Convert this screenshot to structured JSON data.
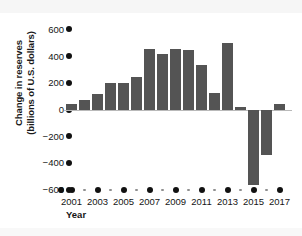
{
  "chart_data": {
    "type": "bar",
    "title": "",
    "xlabel": "Year",
    "ylabel": "Change in reserves\n(billions of U.S. dollars)",
    "categories": [
      2001,
      2002,
      2003,
      2004,
      2005,
      2006,
      2007,
      2008,
      2009,
      2010,
      2011,
      2012,
      2013,
      2014,
      2015,
      2016,
      2017
    ],
    "values": [
      45,
      75,
      120,
      205,
      205,
      250,
      460,
      420,
      460,
      450,
      340,
      130,
      500,
      20,
      -560,
      -340,
      45
    ],
    "ylim": [
      -600,
      600
    ],
    "ytick_labels": [
      "600",
      "400",
      "200",
      "0",
      "−200",
      "−400",
      "−600"
    ],
    "ytick_values": [
      600,
      400,
      200,
      0,
      -200,
      -400,
      -600
    ],
    "xtick_labels": [
      "2001",
      "2003",
      "2005",
      "2007",
      "2009",
      "2011",
      "2013",
      "2015",
      "2017"
    ],
    "xtick_values": [
      2001,
      2003,
      2005,
      2007,
      2009,
      2011,
      2013,
      2015,
      2017
    ],
    "minor_xtick_values": [
      2002,
      2004,
      2006,
      2008,
      2010,
      2012,
      2014,
      2016
    ],
    "grid": false,
    "legend": null,
    "bar_color": "#545454",
    "axis_color": "#111111",
    "zero_line_color": "#b9b9b9"
  }
}
